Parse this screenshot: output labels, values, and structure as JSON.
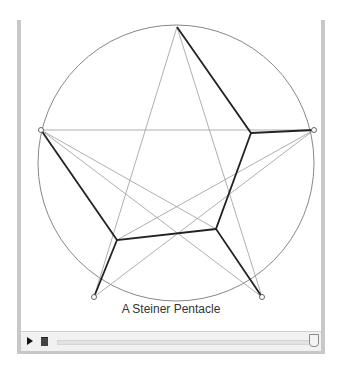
{
  "diagram": {
    "caption": "A Steiner Pentacle",
    "circle": {
      "cx": 155,
      "cy": 143,
      "r": 138,
      "color": "#888888"
    },
    "outer_vertices": [
      {
        "name": "top",
        "x": 156,
        "y": 7
      },
      {
        "name": "right",
        "x": 293,
        "y": 110
      },
      {
        "name": "bottom-right",
        "x": 241,
        "y": 277
      },
      {
        "name": "bottom-left",
        "x": 73,
        "y": 277
      },
      {
        "name": "left",
        "x": 20,
        "y": 110
      }
    ],
    "inner_vertices": [
      {
        "x": 230,
        "y": 113
      },
      {
        "x": 195,
        "y": 209
      },
      {
        "x": 96,
        "y": 220
      }
    ],
    "thin_line_color": "#999999",
    "bold_line_color": "#222222"
  },
  "controls": {
    "play_icon": "play-icon",
    "folder_icon": "folder-icon",
    "slider_value": 100
  }
}
